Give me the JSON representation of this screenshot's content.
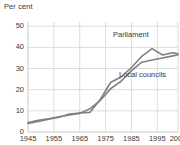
{
  "chart_data": {
    "type": "line",
    "title": "",
    "subtitle": "",
    "xlabel": "",
    "ylabel": "Per cent",
    "ylim": [
      0,
      52
    ],
    "xlim": [
      1945,
      2003
    ],
    "grid": true,
    "legend_position": "inline-annotation",
    "y_ticks": [
      0,
      10,
      20,
      30,
      40,
      50
    ],
    "y_tick_labels": [
      "0",
      "10",
      "20",
      "30",
      "40",
      "50"
    ],
    "x_ticks": [
      1945,
      1955,
      1965,
      1975,
      1985,
      1995,
      2003
    ],
    "x_tick_labels": [
      "1945",
      "1955",
      "1965",
      "1975",
      "1985",
      "1995",
      "2003"
    ],
    "series": [
      {
        "name": "Parliament",
        "color": "#808080",
        "x": [
          1945,
          1949,
          1953,
          1957,
          1961,
          1965,
          1969,
          1973,
          1977,
          1981,
          1985,
          1989,
          1993,
          1997,
          2001,
          2003
        ],
        "values": [
          4.0,
          5.0,
          6.0,
          7.0,
          8.5,
          9.0,
          9.3,
          15.5,
          23.5,
          26.0,
          30.5,
          35.8,
          39.4,
          36.4,
          37.5,
          37.0
        ]
      },
      {
        "name": "Local councils",
        "color": "#808080",
        "x": [
          1945,
          1949,
          1953,
          1957,
          1961,
          1965,
          1969,
          1973,
          1977,
          1981,
          1985,
          1989,
          1993,
          1997,
          2001,
          2003
        ],
        "values": [
          4.5,
          5.5,
          6.3,
          7.2,
          8.0,
          8.8,
          11.0,
          15.0,
          20.5,
          24.0,
          29.0,
          33.0,
          34.0,
          35.0,
          36.0,
          36.5
        ]
      }
    ],
    "annotations": [
      {
        "text": "Parliament",
        "series": "Parliament"
      },
      {
        "text": "Local councils",
        "series": "Local councils"
      }
    ],
    "axis_color": "#c8c8c8",
    "grid_color": "#dcdcdc",
    "text_color": "#3a3a3a"
  }
}
